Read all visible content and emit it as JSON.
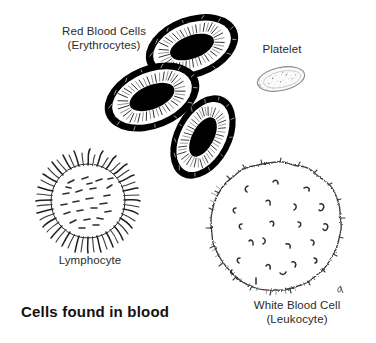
{
  "figure": {
    "caption": "Cells found in blood",
    "background_color": "#ffffff",
    "ink_color": "#111111",
    "style": "black-and-white pen-and-ink scientific illustration",
    "width": 376,
    "height": 343
  },
  "labels": {
    "red_blood_cells": {
      "line1": "Red Blood Cells",
      "line2": "(Erythrocytes)"
    },
    "platelet": {
      "line1": "Platelet"
    },
    "lymphocyte": {
      "line1": "Lymphocyte"
    },
    "white_blood_cell": {
      "line1": "White Blood Cell",
      "line2": "(Leukocyte)"
    }
  },
  "specimens": [
    {
      "name": "red-blood-cell-top",
      "kind": "erythrocyte",
      "shape": "biconcave torus",
      "fill": "#ffffff",
      "outline": "#000000"
    },
    {
      "name": "red-blood-cell-middle",
      "kind": "erythrocyte",
      "shape": "biconcave torus",
      "fill": "#ffffff",
      "outline": "#000000"
    },
    {
      "name": "red-blood-cell-lower",
      "kind": "erythrocyte",
      "shape": "biconcave torus",
      "fill": "#ffffff",
      "outline": "#000000"
    },
    {
      "name": "platelet",
      "kind": "thrombocyte",
      "shape": "small speckled ellipse",
      "fill": "#fbfbfb",
      "outline": "#7a7a7a"
    },
    {
      "name": "lymphocyte",
      "kind": "leukocyte",
      "shape": "round cell with dense microvilli",
      "fill": "#ffffff",
      "outline": "#1a1a1a"
    },
    {
      "name": "white-blood-cell",
      "kind": "leukocyte",
      "shape": "large round cell with crenulated edge and surface marks",
      "fill": "#ffffff",
      "outline": "#333333"
    }
  ]
}
